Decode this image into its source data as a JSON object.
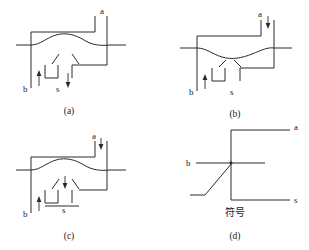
{
  "figure": {
    "background_color": "#ffffff",
    "line_color": "#2b2b2b",
    "text_color": "#1a1a1a",
    "panels": [
      {
        "id": "a",
        "caption": "(a)",
        "terminals": [
          {
            "name": "a",
            "label": "a",
            "arrow": "none"
          },
          {
            "name": "b",
            "label": "b",
            "arrow": "up"
          },
          {
            "name": "s",
            "label": "s",
            "arrow": "down"
          }
        ],
        "junction_curve": "convex"
      },
      {
        "id": "b",
        "caption": "(b)",
        "terminals": [
          {
            "name": "a",
            "label": "a",
            "arrow": "down"
          },
          {
            "name": "b",
            "label": "b",
            "arrow": "up"
          },
          {
            "name": "s",
            "label": "s",
            "arrow": "none"
          }
        ],
        "junction_curve": "concave"
      },
      {
        "id": "c",
        "caption": "(c)",
        "terminals": [
          {
            "name": "a",
            "label": "a",
            "arrow": "down"
          },
          {
            "name": "b",
            "label": "b",
            "arrow": "up"
          },
          {
            "name": "s",
            "label": "s",
            "arrow": "down"
          }
        ],
        "junction_curve": "convex"
      },
      {
        "id": "d",
        "caption": "(d)",
        "symbol_label": "符号",
        "terminals": [
          {
            "name": "a",
            "label": "a",
            "arrow": "none"
          },
          {
            "name": "b",
            "label": "b",
            "arrow": "none"
          },
          {
            "name": "s",
            "label": "s",
            "arrow": "none"
          }
        ]
      }
    ]
  }
}
